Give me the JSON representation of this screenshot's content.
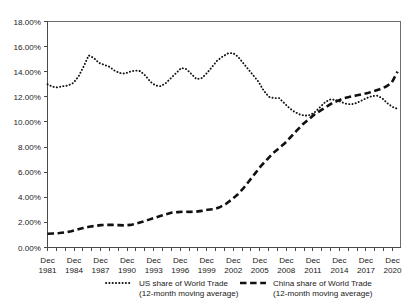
{
  "chart_data": {
    "type": "line",
    "title": "",
    "subtitle": "",
    "xlabel": "",
    "ylabel": "",
    "grid": false,
    "legend_position": "bottom",
    "ylim": [
      0,
      18
    ],
    "ytick_labels": [
      "0.00%",
      "2.00%",
      "4.00%",
      "6.00%",
      "8.00%",
      "10.00%",
      "12.00%",
      "14.00%",
      "16.00%",
      "18.00%"
    ],
    "ytick_values": [
      0,
      2,
      4,
      6,
      8,
      10,
      12,
      14,
      16,
      18
    ],
    "xtick_labels": [
      {
        "month": "Dec",
        "year": "1981"
      },
      {
        "month": "Dec",
        "year": "1984"
      },
      {
        "month": "Dec",
        "year": "1987"
      },
      {
        "month": "Dec",
        "year": "1990"
      },
      {
        "month": "Dec",
        "year": "1993"
      },
      {
        "month": "Dec",
        "year": "1996"
      },
      {
        "month": "Dec",
        "year": "1999"
      },
      {
        "month": "Dec",
        "year": "2002"
      },
      {
        "month": "Dec",
        "year": "2005"
      },
      {
        "month": "Dec",
        "year": "2008"
      },
      {
        "month": "Dec",
        "year": "2011"
      },
      {
        "month": "Dec",
        "year": "2014"
      },
      {
        "month": "Dec",
        "year": "2017"
      },
      {
        "month": "Dec",
        "year": "2020"
      }
    ],
    "x": [
      1981,
      1982,
      1983,
      1984,
      1985,
      1986,
      1987,
      1988,
      1989,
      1990,
      1991,
      1992,
      1993,
      1994,
      1995,
      1996,
      1997,
      1998,
      1999,
      2000,
      2001,
      2002,
      2003,
      2004,
      2005,
      2006,
      2007,
      2008,
      2009,
      2010,
      2011,
      2012,
      2013,
      2014,
      2015,
      2016,
      2017,
      2018,
      2019,
      2020
    ],
    "xlim": [
      1981,
      2020.8
    ],
    "series": [
      {
        "name": "US share of World Trade",
        "sublabel": "(12-month moving average)",
        "style": "dotted",
        "color": "#111111",
        "values": [
          13.0,
          12.8,
          12.85,
          13.1,
          13.6,
          14.6,
          15.3,
          14.9,
          14.6,
          14.5,
          14.2,
          13.95,
          13.85,
          14.0,
          14.1,
          14.05,
          13.6,
          13.1,
          12.85,
          13.2,
          13.6,
          14.0,
          14.35,
          14.1,
          13.6,
          13.4,
          13.7,
          14.3,
          14.9,
          15.25,
          15.5,
          15.3,
          14.6,
          13.8,
          13.2,
          12.6,
          12.0,
          11.35,
          11.1,
          11.0
        ]
      },
      {
        "name": "US share of World Trade (extended)",
        "style": "dotted-tail",
        "color": "#111111",
        "values_tail": [
          11.0,
          10.85,
          10.6,
          10.5,
          10.6,
          10.8,
          11.1,
          11.5,
          11.8,
          11.7,
          11.5,
          11.4,
          11.45,
          11.6,
          11.8,
          12.0,
          12.1,
          12.0,
          11.6,
          11.3,
          11.1
        ]
      },
      {
        "name": "China share of World Trade",
        "sublabel": "(12-month moving average)",
        "style": "dashed",
        "color": "#111111",
        "values": [
          1.1,
          1.12,
          1.2,
          1.35,
          1.5,
          1.62,
          1.72,
          1.8,
          1.82,
          1.8,
          1.75,
          1.82,
          2.0,
          2.25,
          2.45,
          2.7,
          2.8,
          2.85,
          2.82,
          2.9,
          3.0,
          3.1,
          3.4,
          3.9,
          4.5,
          5.2,
          5.9,
          6.6,
          7.3,
          7.8,
          8.2,
          8.9,
          9.6,
          10.2,
          10.7,
          11.1,
          11.5,
          11.9,
          12.2,
          12.4
        ]
      }
    ],
    "series_us_full": [
      13.0,
      12.8,
      12.75,
      12.85,
      12.9,
      13.1,
      13.6,
      14.4,
      15.3,
      15.1,
      14.7,
      14.55,
      14.4,
      14.1,
      13.9,
      13.85,
      14.0,
      14.1,
      14.05,
      13.7,
      13.2,
      12.9,
      12.85,
      13.1,
      13.5,
      13.9,
      14.3,
      14.2,
      13.8,
      13.4,
      13.5,
      13.9,
      14.4,
      14.9,
      15.2,
      15.45,
      15.5,
      15.2,
      14.7,
      14.2,
      13.7,
      13.2,
      12.5,
      12.0,
      11.9,
      11.9,
      11.5,
      11.1,
      10.8,
      10.6,
      10.5,
      10.55,
      10.8,
      11.2,
      11.6,
      11.8,
      11.75,
      11.6,
      11.45,
      11.4,
      11.5,
      11.7,
      11.9,
      12.05,
      12.1,
      11.9,
      11.5,
      11.2,
      11.05
    ],
    "series_china_full": [
      1.1,
      1.12,
      1.15,
      1.2,
      1.3,
      1.42,
      1.55,
      1.65,
      1.72,
      1.78,
      1.8,
      1.8,
      1.78,
      1.76,
      1.8,
      1.9,
      2.05,
      2.2,
      2.35,
      2.5,
      2.65,
      2.78,
      2.82,
      2.85,
      2.84,
      2.85,
      2.92,
      3.0,
      3.05,
      3.2,
      3.45,
      3.8,
      4.2,
      4.7,
      5.3,
      5.9,
      6.5,
      7.0,
      7.5,
      7.9,
      8.3,
      8.8,
      9.3,
      9.8,
      10.2,
      10.6,
      10.9,
      11.2,
      11.5,
      11.7,
      11.9,
      12.0,
      12.1,
      12.2,
      12.3,
      12.45,
      12.6,
      12.8,
      13.1,
      14.0
    ],
    "crossover_note": "China overtakes US around Dec 2011 near 10.5%",
    "us_start_value": 13.0,
    "us_peak_value": 15.5,
    "us_peak_year": 2000,
    "us_end_value": 11.1,
    "china_start_value": 1.1,
    "china_end_value": 14.0
  },
  "legend": {
    "entries": [
      {
        "label": "US share of World Trade",
        "sublabel": "(12-month moving average)",
        "style": "dotted"
      },
      {
        "label": "China share of World Trade",
        "sublabel": "(12-month moving average)",
        "style": "dashed"
      }
    ]
  }
}
